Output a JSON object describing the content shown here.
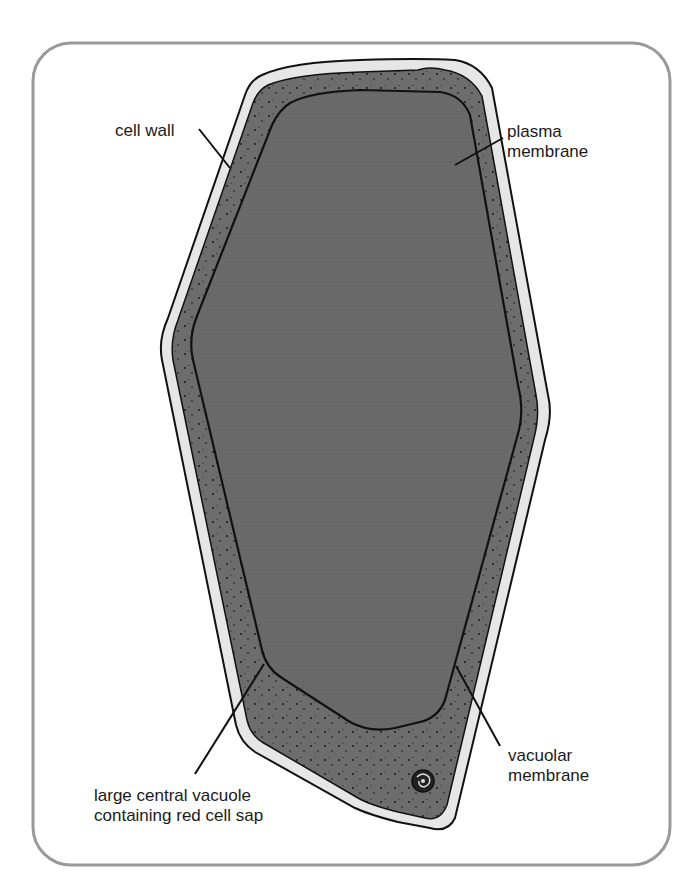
{
  "diagram": {
    "colors": {
      "frame": "#9a9a9a",
      "cell_wall": "#e6e6e6",
      "cytoplasm": "#6d6d6d",
      "vacuole": "#6a6a6a",
      "outline": "#111111",
      "text": "#1a1a1a"
    },
    "labels": {
      "cell_wall": "cell wall",
      "plasma_membrane": "plasma\nmembrane",
      "vacuolar_membrane": "vacuolar\nmembrane",
      "vacuole": "large central vacuole\ncontaining red cell sap"
    },
    "icons": {
      "nucleus": "nucleus-icon"
    }
  }
}
